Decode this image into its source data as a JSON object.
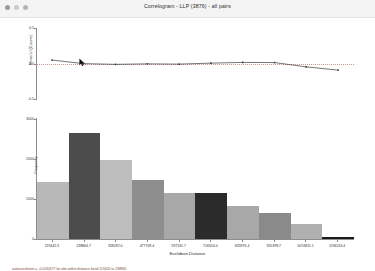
{
  "window": {
    "title": "Correlogram - LLP (3876) - all pairs",
    "controls": [
      "close-dot",
      "minimize-dot",
      "maximize-dot"
    ]
  },
  "chart_data": {
    "type": "bar",
    "title": "Correlogram - LLP (3876) - all pairs",
    "xlabel": "Euclidean Distance",
    "categories": [
      "119442.3",
      "238864.7",
      "358287.0",
      "477709.4",
      "597131.7",
      "716554.0",
      "835976.4",
      "955398.7",
      "1074821.1",
      "1194243.4"
    ],
    "values": [
      1650,
      3080,
      2300,
      1720,
      1340,
      1330,
      950,
      760,
      430,
      60
    ],
    "ylabel": "Frequency",
    "ylim": [
      0,
      3500
    ],
    "yticks": [
      "0",
      "1000",
      "2000",
      "3000"
    ],
    "bar_colors": [
      "#b8b8b8",
      "#4c4c4c",
      "#bdbdbd",
      "#8e8e8e",
      "#a8a8a8",
      "#2b2b2b",
      "#a8a8a8",
      "#8a8a8a",
      "#b0b0b0",
      "#1a1a1a"
    ],
    "overlay": {
      "type": "line",
      "name": "Moran's I / Autocorrelation",
      "ylabel": "Moran's I (Z-score)",
      "ylim": [
        -0.5,
        0.5
      ],
      "yticks": [
        "-0.5",
        "0.0",
        "0.5"
      ],
      "reference_line": 0.0,
      "reference_line_color": "#c3988f",
      "line_color": "#3a3a3a",
      "x": [
        "119442.3",
        "238864.7",
        "358287.0",
        "477709.4",
        "597131.7",
        "716554.0",
        "835976.4",
        "955398.7",
        "1074821.1",
        "1194243.4"
      ],
      "values": [
        0.055,
        0.005,
        -0.005,
        0.002,
        -0.002,
        0.012,
        0.022,
        0.02,
        -0.04,
        -0.085
      ]
    },
    "grid": false,
    "legend": "none"
  },
  "annotations": {
    "footnote": "autocorrelation = -0.0242677 for obs within distance band 119442 to 238865",
    "cursor": "pointer-arrow"
  }
}
